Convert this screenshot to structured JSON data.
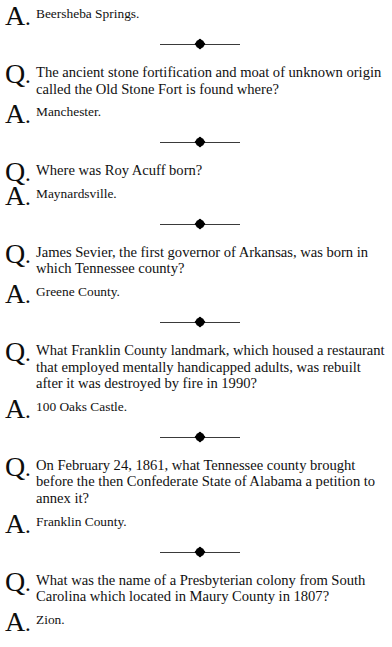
{
  "page": {
    "type": "trivia-question-answer-page",
    "background_color": "#ffffff",
    "text_color": "#111111",
    "question_marker": "Q",
    "answer_marker": "A",
    "marker_punctuation": ".",
    "divider": {
      "name": "diamond-rule-divider",
      "line_color": "#3a3a3a",
      "diamond_color": "#000000"
    }
  },
  "entries": [
    {
      "kind": "answer",
      "marker": "Q",
      "text": "Beersheba Springs."
    },
    {
      "kind": "question",
      "marker": "Q",
      "text": "The ancient stone fortification and moat of unknown origin called the Old Stone Fort is found where?"
    },
    {
      "kind": "answer",
      "marker": "A",
      "text": "Manchester."
    },
    {
      "kind": "question",
      "marker": "Q",
      "text": "Where was Roy Acuff born?"
    },
    {
      "kind": "answer",
      "marker": "A",
      "text": "Maynardsville."
    },
    {
      "kind": "question",
      "marker": "Q",
      "text": "James Sevier, the first governor of Arkansas, was born in which Tennessee county?"
    },
    {
      "kind": "answer",
      "marker": "A",
      "text": "Greene County."
    },
    {
      "kind": "question",
      "marker": "Q",
      "text": "What Franklin County landmark, which housed a restaurant that employed mentally handicapped adults, was rebuilt after it was destroyed by fire in 1990?"
    },
    {
      "kind": "answer",
      "marker": "A",
      "text": "100 Oaks Castle."
    },
    {
      "kind": "question",
      "marker": "Q",
      "text": "On February 24, 1861, what Tennessee county brought before the then Confederate State of Alabama a petition to annex it?"
    },
    {
      "kind": "answer",
      "marker": "A",
      "text": "Franklin County."
    },
    {
      "kind": "question",
      "marker": "Q",
      "text": "What was the name of a Presbyterian colony from South Carolina which located in Maury County in 1807?"
    },
    {
      "kind": "answer",
      "marker": "A",
      "text": "Zion."
    }
  ],
  "markers": {
    "answer_0": "A",
    "q_1": "Q",
    "a_2": "A",
    "q_3": "Q",
    "a_4": "A",
    "q_5": "Q",
    "a_6": "A",
    "q_7": "Q",
    "a_8": "A",
    "q_9": "Q",
    "a_10": "A",
    "q_11": "Q",
    "a_12": "A",
    "dot": "."
  }
}
